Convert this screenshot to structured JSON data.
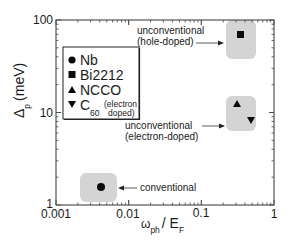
{
  "chart_data": {
    "type": "scatter",
    "title": "",
    "xlabel": "ω_ph / E_F",
    "xlabel_main": "ω",
    "xlabel_sub": "ph",
    "xlabel_sep": "/ E",
    "xlabel_sub2": "F",
    "ylabel": "Δ_p (meV)",
    "ylabel_main": "Δ",
    "ylabel_sub": "p",
    "ylabel_unit": "(meV)",
    "xscale": "log",
    "yscale": "log",
    "xlim": [
      0.001,
      1
    ],
    "ylim": [
      1,
      100
    ],
    "xticks": [
      "0.001",
      "0.01",
      "0.1",
      "1"
    ],
    "yticks": [
      "1",
      "10",
      "100"
    ],
    "grid": false,
    "legend_position": "upper left",
    "series": [
      {
        "name": "Nb",
        "marker": "circle",
        "x": [
          0.0042
        ],
        "y": [
          1.55
        ]
      },
      {
        "name": "Bi2212",
        "marker": "square",
        "x": [
          0.35
        ],
        "y": [
          69
        ]
      },
      {
        "name": "NCCO",
        "marker": "triangle-up",
        "x": [
          0.31
        ],
        "y": [
          12.3
        ]
      },
      {
        "name": "C60 (electron doped)",
        "marker": "triangle-down",
        "x": [
          0.48
        ],
        "y": [
          8.3
        ]
      }
    ],
    "legend": [
      {
        "label": "Nb",
        "marker": "circle"
      },
      {
        "label": "Bi2212",
        "marker": "square"
      },
      {
        "label": "NCCO",
        "marker": "triangle-up"
      },
      {
        "label": "C",
        "sub": "60",
        "note1": "(electron",
        "note2": "doped)",
        "marker": "triangle-down"
      }
    ],
    "annotations": [
      {
        "text": "unconventional",
        "text2": "(hole-doped)",
        "target": "Bi2212"
      },
      {
        "text": "unconventional",
        "text2": "(electron-doped)",
        "target": "NCCO/C60"
      },
      {
        "text": "conventional",
        "target": "Nb"
      }
    ],
    "colors": {
      "marker": "#0a0a0a",
      "highlight_box": "#d4d4d4",
      "axis": "#333333"
    }
  }
}
